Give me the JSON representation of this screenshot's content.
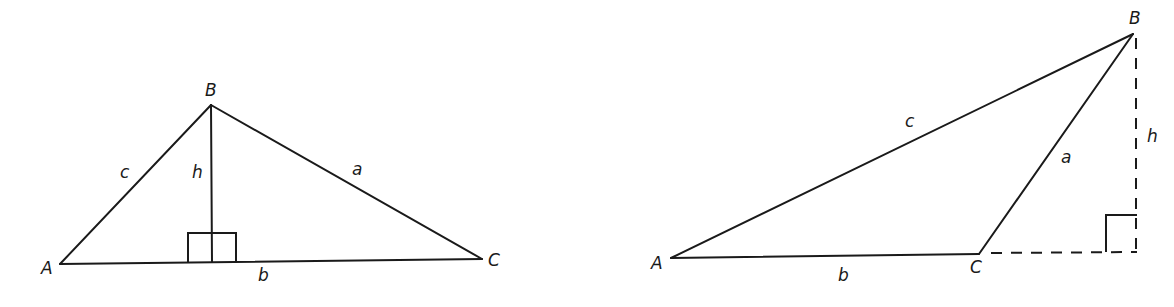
{
  "figure": {
    "colors": {
      "stroke": "#1a1a1a",
      "background": "#ffffff"
    }
  },
  "left_triangle": {
    "type": "acute",
    "vertices": {
      "A": {
        "label": "A",
        "x": 60,
        "y": 264
      },
      "B": {
        "label": "B",
        "x": 211,
        "y": 105
      },
      "C": {
        "label": "C",
        "x": 482,
        "y": 259
      }
    },
    "sides": {
      "a": "a",
      "b": "b",
      "c": "c"
    },
    "altitude": {
      "label": "h",
      "style": "solid"
    },
    "right_angle_marker": true
  },
  "right_triangle": {
    "type": "obtuse",
    "vertices": {
      "A": {
        "label": "A",
        "x": 671,
        "y": 258
      },
      "B": {
        "label": "B",
        "x": 1133,
        "y": 34
      },
      "C": {
        "label": "C",
        "x": 979,
        "y": 254
      }
    },
    "sides": {
      "a": "a",
      "b": "b",
      "c": "c"
    },
    "altitude": {
      "label": "h",
      "style": "dashed"
    },
    "extension": {
      "style": "dashed"
    },
    "right_angle_marker": true
  }
}
